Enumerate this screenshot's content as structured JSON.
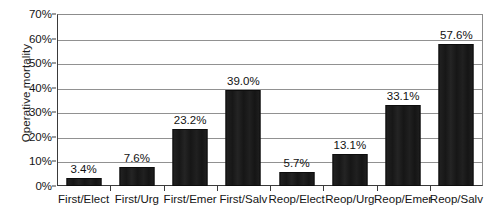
{
  "chart_data": {
    "type": "bar",
    "title": "",
    "xlabel": "",
    "ylabel": "Operative mortality",
    "ylim": [
      0,
      70
    ],
    "ytick_step": 10,
    "ytick_labels": [
      "0%",
      "10%",
      "20%",
      "30%",
      "40%",
      "50%",
      "60%",
      "70%"
    ],
    "ytick_values": [
      0,
      10,
      20,
      30,
      40,
      50,
      60,
      70
    ],
    "grid": true,
    "legend": "none",
    "categories": [
      "First/Elect",
      "First/Urg",
      "First/Emer",
      "First/Salv",
      "Reop/Elect",
      "Reop/Urg",
      "Reop/Emer",
      "Reop/Salv"
    ],
    "values": [
      3.4,
      7.6,
      23.2,
      39.0,
      5.7,
      13.1,
      33.1,
      57.6
    ],
    "data_labels": [
      "3.4%",
      "7.6%",
      "23.2%",
      "39.0%",
      "5.7%",
      "13.1%",
      "33.1%",
      "57.6%"
    ],
    "bar_color": "#1c1c1c",
    "gridline_color": "#919191",
    "axis_color": "#3a3a3a",
    "background_color": "#ffffff"
  }
}
